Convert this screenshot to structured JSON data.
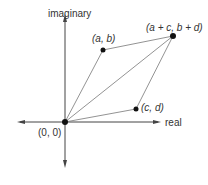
{
  "diagram": {
    "axes": {
      "vertical_label": "imaginary",
      "horizontal_label": "real"
    },
    "points": [
      {
        "id": "origin",
        "label": "(0, 0)",
        "x": 65,
        "y": 122
      },
      {
        "id": "a_b",
        "label": "(a, b)",
        "x": 103,
        "y": 50
      },
      {
        "id": "sum",
        "label": "(a + c, b + d)",
        "x": 173,
        "y": 36
      },
      {
        "id": "c_d",
        "label": "(c, d)",
        "x": 136,
        "y": 109
      }
    ],
    "colors": {
      "axis": "#444444",
      "edge": "#777777",
      "point": "#111111",
      "text": "#333333"
    }
  }
}
